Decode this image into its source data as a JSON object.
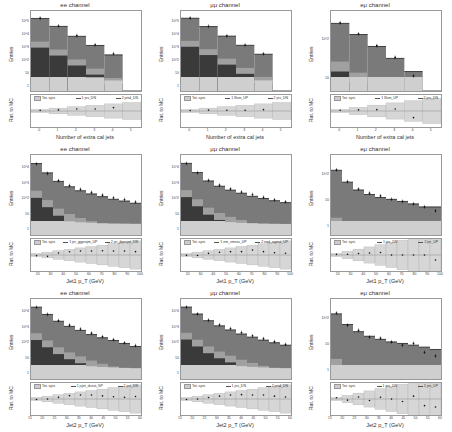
{
  "chart_data": [
    {
      "type": "bar",
      "panel": "row1-col1",
      "title": "ee channel",
      "xlabel": "Number of extra cal jets",
      "ylabel": "Entries",
      "ratio_ylabel": "Rat. to MC",
      "yscale": "log",
      "categories": [
        "0",
        "1",
        "2",
        "3",
        "4",
        "5"
      ],
      "series": [
        {
          "name": "total_MC",
          "values": [
            30000,
            9000,
            2000,
            500,
            120,
            0
          ]
        },
        {
          "name": "data",
          "values": [
            31000,
            9500,
            2200,
            550,
            140,
            0
          ]
        }
      ],
      "legend": [
        "Tot. syst.",
        "1 jes_DN",
        "2 jetid_DN"
      ],
      "ytick_labels": [
        "1",
        "10",
        "10^2",
        "10^3",
        "10^4",
        "10^5"
      ],
      "ratio_ylim": [
        0.4,
        1.6
      ]
    },
    {
      "type": "bar",
      "panel": "row1-col2",
      "title": "μμ channel",
      "xlabel": "Number of extra cal jets",
      "ylabel": "Entries",
      "ratio_ylabel": "Rat. to MC",
      "yscale": "log",
      "categories": [
        "0",
        "1",
        "2",
        "3",
        "4",
        "5"
      ],
      "series": [
        {
          "name": "total_MC",
          "values": [
            40000,
            11000,
            2500,
            600,
            150,
            0
          ]
        },
        {
          "name": "data",
          "values": [
            41000,
            11500,
            2600,
            620,
            160,
            0
          ]
        }
      ],
      "legend": [
        "Tot. syst.",
        "1 lllum_UP",
        "2 jes_DN"
      ],
      "ytick_labels": [
        "1",
        "10",
        "10^2",
        "10^3",
        "10^4",
        "10^5"
      ],
      "ratio_ylim": [
        0.4,
        1.6
      ]
    },
    {
      "type": "bar",
      "panel": "row1-col3",
      "title": "eμ channel",
      "xlabel": "Number of extra cal jets",
      "ylabel": "Entries",
      "ratio_ylabel": "Rat. to MC",
      "yscale": "log",
      "categories": [
        "0",
        "1",
        "2",
        "3",
        "4",
        "5"
      ],
      "series": [
        {
          "name": "total_MC",
          "values": [
            250,
            90,
            30,
            10,
            3,
            0
          ]
        },
        {
          "name": "data",
          "values": [
            260,
            95,
            32,
            11,
            2,
            0
          ]
        }
      ],
      "legend": [
        "Tot. syst.",
        "1 lllum_UP",
        "2 jes_DN"
      ],
      "ytick_labels": [
        "10",
        "10^2"
      ],
      "ratio_ylim": [
        0.2,
        1.8
      ]
    },
    {
      "type": "bar",
      "panel": "row2-col1",
      "title": "ee channel",
      "xlabel": "Jet1 p_T (GeV)",
      "ylabel": "Entries",
      "ratio_ylabel": "Rat. to MC",
      "yscale": "log",
      "x": [
        15,
        20,
        30,
        40,
        50,
        60,
        70,
        80,
        90,
        100
      ],
      "series": [
        {
          "name": "total_MC",
          "values": [
            5000,
            1500,
            500,
            250,
            150,
            100,
            70,
            50,
            40,
            30
          ]
        },
        {
          "name": "data",
          "values": [
            4800,
            1400,
            550,
            290,
            180,
            120,
            85,
            60,
            48,
            35
          ]
        }
      ],
      "legend": [
        "Tot. syst.",
        "1 jer_ggprojm_UP",
        "2 jer_jbprojm_DN"
      ],
      "xtick_labels": [
        "20",
        "30",
        "40",
        "50",
        "60",
        "70",
        "80",
        "90",
        "100"
      ],
      "ytick_labels": [
        "1",
        "10",
        "10^2",
        "10^3",
        "10^4"
      ],
      "ratio_ylim": [
        0.7,
        1.4
      ]
    },
    {
      "type": "bar",
      "panel": "row2-col2",
      "title": "μμ channel",
      "xlabel": "Jet1 p_T (GeV)",
      "ylabel": "Entries",
      "ratio_ylabel": "Rat. to MC",
      "yscale": "log",
      "x": [
        15,
        20,
        30,
        40,
        50,
        60,
        70,
        80,
        90,
        100
      ],
      "series": [
        {
          "name": "total_MC",
          "values": [
            6000,
            1800,
            600,
            300,
            180,
            120,
            80,
            60,
            45,
            35
          ]
        },
        {
          "name": "data",
          "values": [
            5900,
            1750,
            650,
            340,
            210,
            140,
            100,
            70,
            50,
            38
          ]
        }
      ],
      "legend": [
        "Tot. syst.",
        "1 em_smear_UP",
        "2 eqd_sigma_UP"
      ],
      "xtick_labels": [
        "20",
        "30",
        "40",
        "50",
        "60",
        "70",
        "80",
        "90",
        "100"
      ],
      "ytick_labels": [
        "1",
        "10",
        "10^2",
        "10^3",
        "10^4"
      ],
      "ratio_ylim": [
        0.4,
        1.6
      ]
    },
    {
      "type": "bar",
      "panel": "row2-col3",
      "title": "eμ channel",
      "xlabel": "Jet1 p_T (GeV)",
      "ylabel": "Entries",
      "ratio_ylabel": "Rat. to MC",
      "yscale": "log",
      "x": [
        15,
        20,
        30,
        40,
        50,
        60,
        70,
        80,
        90,
        100
      ],
      "series": [
        {
          "name": "total_MC",
          "values": [
            60,
            25,
            14,
            10,
            8,
            7,
            6,
            5,
            4,
            4
          ]
        },
        {
          "name": "data",
          "values": [
            62,
            26,
            15,
            11,
            9,
            7,
            6,
            5,
            4,
            3
          ]
        }
      ],
      "legend": [
        "Tot. syst.",
        "1 jes_DN",
        "2 jer_UP"
      ],
      "xtick_labels": [
        "20",
        "30",
        "40",
        "50",
        "60",
        "70",
        "80",
        "90",
        "100"
      ],
      "ytick_labels": [
        "1",
        "10",
        "10^2"
      ],
      "ratio_ylim": [
        0.2,
        1.8
      ]
    },
    {
      "type": "bar",
      "panel": "row3-col1",
      "title": "ee channel",
      "xlabel": "Jet2 p_T (GeV)",
      "ylabel": "Entries",
      "ratio_ylabel": "Rat. to MC",
      "yscale": "log",
      "x": [
        15,
        20,
        25,
        30,
        35,
        40,
        45,
        50,
        55,
        60
      ],
      "series": [
        {
          "name": "total_MC",
          "values": [
            8000,
            3000,
            1200,
            600,
            350,
            200,
            130,
            90,
            60,
            40
          ]
        },
        {
          "name": "data",
          "values": [
            7800,
            3000,
            1300,
            700,
            420,
            240,
            150,
            100,
            65,
            45
          ]
        }
      ],
      "legend": [
        "Tot. syst.",
        "1 jsjet_dusst_SP",
        "2 jes_DN"
      ],
      "xtick_labels": [
        "15",
        "20",
        "25",
        "30",
        "35",
        "40",
        "45",
        "50",
        "55",
        "60"
      ],
      "ytick_labels": [
        "1",
        "10",
        "10^2",
        "10^3",
        "10^4"
      ],
      "ratio_ylim": [
        0.4,
        1.6
      ]
    },
    {
      "type": "bar",
      "panel": "row3-col2",
      "title": "μμ channel",
      "xlabel": "Jet2 p_T (GeV)",
      "ylabel": "Entries",
      "ratio_ylabel": "Rat. to MC",
      "yscale": "log",
      "x": [
        15,
        20,
        25,
        30,
        35,
        40,
        45,
        50,
        55,
        60
      ],
      "series": [
        {
          "name": "total_MC",
          "values": [
            9000,
            3500,
            1400,
            700,
            400,
            230,
            150,
            100,
            70,
            50
          ]
        },
        {
          "name": "data",
          "values": [
            8800,
            3500,
            1500,
            800,
            480,
            280,
            180,
            120,
            80,
            55
          ]
        }
      ],
      "legend": [
        "Tot. syst.",
        "1 jes_DN",
        "2 jetid_DN"
      ],
      "xtick_labels": [
        "15",
        "20",
        "25",
        "30",
        "35",
        "40",
        "45",
        "50",
        "55",
        "60"
      ],
      "ytick_labels": [
        "1",
        "10",
        "10^2",
        "10^3",
        "10^4"
      ],
      "ratio_ylim": [
        0.4,
        1.6
      ]
    },
    {
      "type": "bar",
      "panel": "row3-col3",
      "title": "eμ channel",
      "xlabel": "Jet2 p_T (GeV)",
      "ylabel": "Entries",
      "ratio_ylabel": "Rat. to MC",
      "yscale": "log",
      "x": [
        15,
        20,
        25,
        30,
        35,
        40,
        45,
        50,
        55,
        60
      ],
      "series": [
        {
          "name": "total_MC",
          "values": [
            80,
            35,
            20,
            14,
            11,
            9,
            8,
            7,
            6,
            5
          ]
        },
        {
          "name": "data",
          "values": [
            85,
            33,
            22,
            13,
            12,
            9,
            7,
            8,
            4,
            3
          ]
        }
      ],
      "legend": [
        "Tot. syst.",
        "1 jes_DN",
        "2 jes_UP"
      ],
      "xtick_labels": [
        "15",
        "20",
        "25",
        "30",
        "35",
        "40",
        "45",
        "50",
        "55",
        "60"
      ],
      "ytick_labels": [
        "1",
        "10",
        "10^2"
      ],
      "ratio_ylim": [
        0.4,
        1.6
      ]
    }
  ],
  "labels": {
    "entries": "Entries",
    "ratio": "Rat. to MC"
  },
  "colors": {
    "dominant_bkg": "#7a7a7a",
    "dark_bkg": "#3a3a3a",
    "mid_bkg": "#a0a0a0",
    "light_bkg": "#cfcfcf",
    "syst_band": "#d6d6d6",
    "data_marker": "#111111"
  }
}
